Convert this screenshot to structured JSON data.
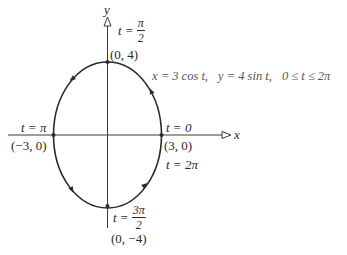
{
  "diagram": {
    "type": "parametric-ellipse",
    "equation": {
      "x_part": "x = 3 cos t,",
      "y_part": "y = 4 sin t,",
      "range": "0 ≤ t ≤ 2π"
    },
    "axes": {
      "x_label": "x",
      "y_label": "y"
    },
    "points": {
      "top": {
        "coord": "(0, 4)",
        "t_prefix": "t =",
        "t_num": "π",
        "t_den": "2"
      },
      "right": {
        "coord": "(3, 0)",
        "t_start": "t = 0",
        "t_end": "t = 2π"
      },
      "left": {
        "coord": "(−3, 0)",
        "t_label": "t = π"
      },
      "bottom": {
        "coord": "(0, −4)",
        "t_prefix": "t =",
        "t_num": "3π",
        "t_den": "2"
      }
    },
    "direction": "counterclockwise",
    "colors": {
      "curve": "#2a2a2a",
      "axis": "#3a3a3a",
      "text": "#2a2a2a"
    }
  }
}
